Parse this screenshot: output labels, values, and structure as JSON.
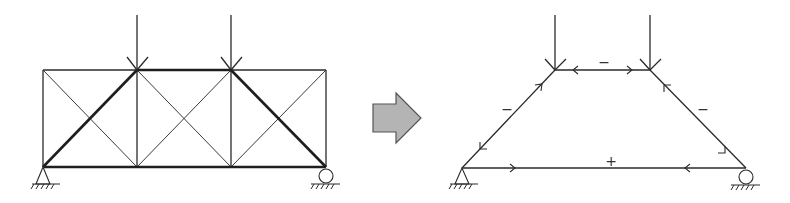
{
  "figure": {
    "left_panel": {
      "title": "Cross-braced truss under two point loads",
      "nodes_top_x": [
        43,
        137,
        231,
        326
      ],
      "top_y": 70,
      "bottom_y": 167,
      "loads": [
        {
          "x": 137,
          "label": ""
        },
        {
          "x": 231,
          "label": ""
        }
      ],
      "supports": {
        "left": "pin",
        "right": "roller"
      },
      "emphasized_members": [
        "bottom-chord",
        "top-middle-chord",
        "left-diagonal",
        "right-diagonal"
      ]
    },
    "transition_arrow": {
      "direction": "right",
      "fill_color": "#b4b4b4",
      "stroke_color": "#555555"
    },
    "right_panel": {
      "title": "Equivalent arch/tie force path",
      "nodes": {
        "bottom_left": [
          462,
          168
        ],
        "top_left": [
          555,
          70
        ],
        "top_right": [
          650,
          70
        ],
        "bottom_right": [
          746,
          168
        ]
      },
      "supports": {
        "left": "pin",
        "right": "roller"
      },
      "member_signs": {
        "top_chord": "−",
        "left_strut": "−",
        "right_strut": "−",
        "bottom_tie": "+"
      }
    }
  }
}
